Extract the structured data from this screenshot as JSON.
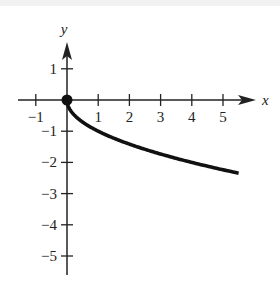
{
  "chart_data": {
    "type": "line",
    "title": "",
    "xlabel": "x",
    "ylabel": "y",
    "xlim": [
      -1.5,
      5.9
    ],
    "ylim": [
      -5.5,
      2.2
    ],
    "x_ticks": [
      -1,
      1,
      2,
      3,
      4,
      5
    ],
    "y_ticks": [
      1,
      -1,
      -2,
      -3,
      -4,
      -5
    ],
    "x_tick_labels": [
      "−1",
      "1",
      "2",
      "3",
      "4",
      "5"
    ],
    "y_tick_labels": [
      "1",
      "−1",
      "−2",
      "−3",
      "−4",
      "−5"
    ],
    "grid": false,
    "legend": null,
    "series": [
      {
        "name": "y = -sqrt(x)",
        "x": [
          0,
          0.25,
          0.5,
          1,
          1.5,
          2,
          2.5,
          3,
          3.5,
          4,
          4.5,
          5,
          5.5
        ],
        "values": [
          0,
          -0.5,
          -0.71,
          -1,
          -1.22,
          -1.41,
          -1.58,
          -1.73,
          -1.87,
          -2,
          -2.12,
          -2.24,
          -2.35
        ],
        "color": "#111111"
      }
    ],
    "annotations": [
      {
        "type": "closed-point",
        "x": 0,
        "y": 0
      }
    ]
  },
  "labels": {
    "x_axis": "x",
    "y_axis": "y"
  }
}
